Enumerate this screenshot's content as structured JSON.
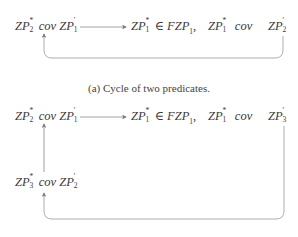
{
  "figure_a": {
    "nodes": [
      {
        "id": "a1",
        "base": "ZP",
        "sub": "2",
        "sup": "*",
        "rel": "cov",
        "base2": "ZP",
        "sub2": "1",
        "sup2": "′"
      },
      {
        "id": "a2",
        "base": "ZP",
        "sub": "1",
        "sup": "*",
        "rel": "∈",
        "rhs": "FZP",
        "rhs_sub": "1",
        "trail": ","
      },
      {
        "id": "a3",
        "base": "ZP",
        "sub": "1",
        "sup": "*",
        "rel": "cov"
      },
      {
        "id": "a4",
        "base": "ZP",
        "sub": "2",
        "sup": "′"
      }
    ],
    "caption": "(a) Cycle of two predicates."
  },
  "figure_b": {
    "nodes": [
      {
        "id": "b1",
        "base": "ZP",
        "sub": "2",
        "sup": "*",
        "rel": "cov",
        "base2": "ZP",
        "sub2": "1",
        "sup2": "′"
      },
      {
        "id": "b2",
        "base": "ZP",
        "sub": "1",
        "sup": "*",
        "rel": "∈",
        "rhs": "FZP",
        "rhs_sub": "1",
        "trail": ","
      },
      {
        "id": "b3",
        "base": "ZP",
        "sub": "1",
        "sup": "*",
        "rel": "cov"
      },
      {
        "id": "b4",
        "base": "ZP",
        "sub": "3",
        "sup": "′"
      },
      {
        "id": "b5",
        "base": "ZP",
        "sub": "3",
        "sup": "*",
        "rel": "cov",
        "base2": "ZP",
        "sub2": "2",
        "sup2": "′"
      }
    ]
  },
  "colors": {
    "line": "#8a8a8a",
    "text": "#3a3a3a"
  }
}
